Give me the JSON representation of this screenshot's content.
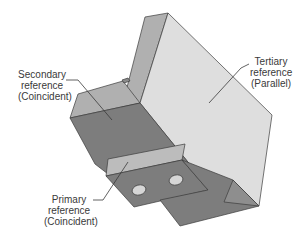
{
  "figure": {
    "colors": {
      "background": "#ffffff",
      "top_face": "#b0b0b0",
      "dark_face": "#7d7d7d",
      "light_face": "#dedede",
      "vertical_wall": "#a9a9a9",
      "edge": "#3c3c3c",
      "hole": "#d6d6d6",
      "leader": "#3a3a3a",
      "text": "#3a3a3a"
    }
  },
  "labels": {
    "secondary": {
      "line1": "Secondary",
      "line2": "reference",
      "line3": "(Coincident)"
    },
    "tertiary": {
      "line1": "Tertiary",
      "line2": "reference",
      "line3": "(Parallel)"
    },
    "primary": {
      "line1": "Primary",
      "line2": "reference",
      "line3": "(Coincident)"
    }
  }
}
